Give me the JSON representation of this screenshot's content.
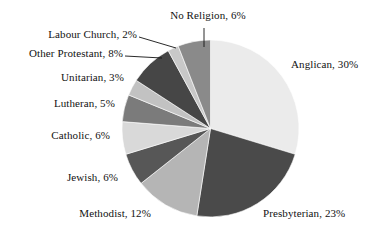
{
  "chart_data": {
    "type": "pie",
    "title": "",
    "subtitle": "",
    "xlabel": "",
    "ylabel": "",
    "legend_position": "none",
    "grid": false,
    "start_angle_deg": 0,
    "direction": "clockwise",
    "units": "percent",
    "categories": [
      "Anglican",
      "Presbyterian",
      "Methodist",
      "Jewish",
      "Catholic",
      "Lutheran",
      "Unitarian",
      "Other Protestant",
      "Labour Church",
      "No Religion"
    ],
    "values": [
      30,
      23,
      12,
      6,
      6,
      5,
      3,
      8,
      2,
      6
    ],
    "slices": [
      {
        "label": "Anglican",
        "value": 30,
        "text": "Anglican, 30%",
        "color": "#ebebeb",
        "label_side": "right",
        "leader": false
      },
      {
        "label": "Presbyterian",
        "value": 23,
        "text": "Presbyterian, 23%",
        "color": "#4a4a4a",
        "label_side": "right",
        "leader": false
      },
      {
        "label": "Methodist",
        "value": 12,
        "text": "Methodist, 12%",
        "color": "#b5b5b5",
        "label_side": "bottom",
        "leader": false
      },
      {
        "label": "Jewish",
        "value": 6,
        "text": "Jewish, 6%",
        "color": "#575757",
        "label_side": "left",
        "leader": false
      },
      {
        "label": "Catholic",
        "value": 6,
        "text": "Catholic, 6%",
        "color": "#d9d9d9",
        "label_side": "left",
        "leader": false
      },
      {
        "label": "Lutheran",
        "value": 5,
        "text": "Lutheran, 5%",
        "color": "#7b7b7b",
        "label_side": "left",
        "leader": false
      },
      {
        "label": "Unitarian",
        "value": 3,
        "text": "Unitarian, 3%",
        "color": "#c2c2c2",
        "label_side": "left",
        "leader": false
      },
      {
        "label": "Other Protestant",
        "value": 8,
        "text": "Other Protestant, 8%",
        "color": "#464646",
        "label_side": "left",
        "leader": true
      },
      {
        "label": "Labour Church",
        "value": 2,
        "text": "Labour Church, 2%",
        "color": "#c8c8c8",
        "label_side": "left",
        "leader": true
      },
      {
        "label": "No Religion",
        "value": 6,
        "text": "No Religion, 6%",
        "color": "#8a8a8a",
        "label_side": "top",
        "leader": true
      }
    ]
  },
  "labels": {
    "anglican": "Anglican, 30%",
    "presbyterian": "Presbyterian, 23%",
    "methodist": "Methodist, 12%",
    "jewish": "Jewish, 6%",
    "catholic": "Catholic, 6%",
    "lutheran": "Lutheran, 5%",
    "unitarian": "Unitarian, 3%",
    "other_protestant": "Other Protestant, 8%",
    "labour_church": "Labour Church, 2%",
    "no_religion": "No Religion, 6%"
  }
}
